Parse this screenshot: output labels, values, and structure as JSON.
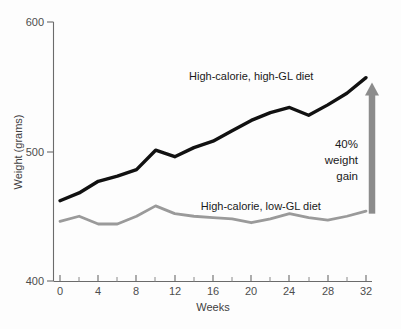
{
  "chart_data": {
    "type": "line",
    "title": "",
    "xlabel": "Weeks",
    "ylabel": "Weight (grams)",
    "xlim": [
      0,
      32
    ],
    "ylim": [
      400,
      600
    ],
    "xticks": [
      0,
      4,
      8,
      12,
      16,
      20,
      24,
      28,
      32
    ],
    "xtick_labels": [
      "0",
      "4",
      "8",
      "12",
      "16",
      "20",
      "24",
      "28",
      "32"
    ],
    "x_minor_ticks": [
      2,
      6,
      10,
      14,
      18,
      22,
      26,
      30
    ],
    "yticks": [
      400,
      500,
      600
    ],
    "ytick_labels": [
      "400",
      "500",
      "600"
    ],
    "grid": false,
    "legend_position": "inline-annotation",
    "x": [
      0,
      2,
      4,
      6,
      8,
      10,
      12,
      14,
      16,
      18,
      20,
      22,
      24,
      26,
      28,
      30,
      32
    ],
    "series": [
      {
        "name": "High-calorie, high-GL diet",
        "color": "#111111",
        "label_x": 20,
        "label_y": 555,
        "values": [
          462,
          468,
          477,
          481,
          486,
          501,
          496,
          503,
          508,
          516,
          524,
          530,
          534,
          528,
          536,
          545,
          557
        ]
      },
      {
        "name": "High-calorie, low-GL diet",
        "color": "#9a9a9a",
        "label_x": 21,
        "label_y": 455,
        "values": [
          446,
          450,
          444,
          444,
          450,
          458,
          452,
          450,
          449,
          448,
          445,
          448,
          452,
          449,
          447,
          450,
          454
        ]
      }
    ],
    "annotations": [
      {
        "name": "weight-gain-callout",
        "lines": [
          "40%",
          "weight",
          "gain"
        ],
        "arrow": {
          "direction": "up",
          "color": "#8c8c8c",
          "x_week": 32,
          "from_value": 452,
          "to_value": 544
        }
      }
    ]
  },
  "axes": {
    "y_axis_title": "Weight (grams)",
    "x_axis_title": "Weeks"
  }
}
